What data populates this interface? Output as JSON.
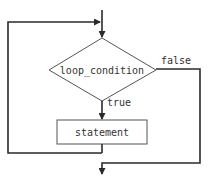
{
  "diagram": {
    "type": "flowchart",
    "nodes": {
      "condition": {
        "label": "loop_condition",
        "shape": "diamond"
      },
      "statement": {
        "label": "statement",
        "shape": "rectangle"
      }
    },
    "edges": {
      "true_label": "true",
      "false_label": "false"
    },
    "colors": {
      "line": "#2a2a2a",
      "shape_border": "#555555",
      "text": "#333333",
      "background": "#ffffff"
    }
  }
}
